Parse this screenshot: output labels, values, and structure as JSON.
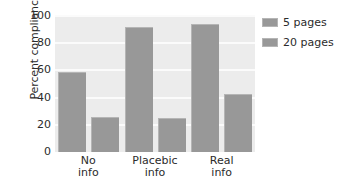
{
  "chart_data": {
    "type": "bar",
    "title": "",
    "xlabel": "",
    "ylabel": "Percent compliance",
    "ylim": [
      0,
      100
    ],
    "yticks": [
      100,
      80,
      60,
      40,
      20,
      0
    ],
    "grid": true,
    "legend_position": "right",
    "categories": [
      "No info",
      "Placebic info",
      "Real info"
    ],
    "category_lines": [
      {
        "line1": "No",
        "line2": "info"
      },
      {
        "line1": "Placebic",
        "line2": "info"
      },
      {
        "line1": "Real",
        "line2": "info"
      }
    ],
    "series": [
      {
        "name": "5 pages",
        "values": [
          59,
          92,
          94
        ],
        "color": "#989898"
      },
      {
        "name": "20 pages",
        "values": [
          26,
          25,
          43
        ],
        "color": "#989898"
      }
    ]
  },
  "legend": {
    "items": [
      {
        "label": "5 pages"
      },
      {
        "label": "20 pages"
      }
    ]
  },
  "colors": {
    "bar": "#989898",
    "bar_edge": "#b5b5b5",
    "plot_background": "#ececec",
    "gridline": "#fbfbfb",
    "figure_background": "#ffffff",
    "text": "#2b2b2b"
  }
}
